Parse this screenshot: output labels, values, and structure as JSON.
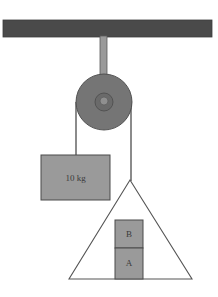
{
  "diagram": {
    "canvas": {
      "width": 218,
      "height": 297,
      "background": "#ffffff"
    },
    "colors": {
      "ceiling": "#4a4a4a",
      "pulley_wheel": "#757575",
      "pulley_hub": "#6a6a6a",
      "pulley_axle": "#8f8f8f",
      "support_rod": "#9a9a9a",
      "block_fill": "#9a9a9a",
      "block_stroke": "#4a4a4a",
      "rope": "#6e6e6e",
      "wedge_fill": "#ffffff",
      "wedge_stroke": "#555555",
      "text": "#3a3a3a"
    },
    "ceiling": {
      "name": "ceiling-beam",
      "x": 3,
      "y": 20,
      "width": 209,
      "height": 17
    },
    "support_rod": {
      "name": "support-rod",
      "x": 100,
      "y": 36,
      "width": 7,
      "height": 66
    },
    "pulley": {
      "name": "pulley-wheel",
      "cx": 104,
      "cy": 102,
      "radius": 28,
      "hub_radius": 9,
      "axle_radius": 4
    },
    "ropes": [
      {
        "name": "rope-left",
        "x1": 76,
        "y1": 102,
        "x2": 76,
        "y2": 156
      },
      {
        "name": "rope-right",
        "x1": 131,
        "y1": 102,
        "x2": 131,
        "y2": 181
      }
    ],
    "hanging_block": {
      "name": "hanging-mass-block",
      "label": "10 kg",
      "x": 41,
      "y": 155,
      "width": 69,
      "height": 45
    },
    "wedge": {
      "name": "wedge-triangle",
      "apex": {
        "x": 130,
        "y": 180
      },
      "left_base": {
        "x": 69,
        "y": 279
      },
      "right_base": {
        "x": 192,
        "y": 279
      }
    },
    "stacked_blocks": [
      {
        "name": "block-b",
        "label": "B",
        "x": 115,
        "y": 220,
        "width": 28,
        "height": 28
      },
      {
        "name": "block-a",
        "label": "A",
        "x": 115,
        "y": 248,
        "width": 28,
        "height": 31
      }
    ]
  }
}
